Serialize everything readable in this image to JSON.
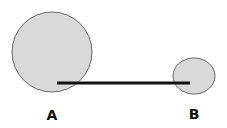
{
  "diagram": {
    "nodes": [
      {
        "id": "A",
        "label": "A",
        "cx": 52,
        "cy": 52,
        "rx": 40,
        "ry": 40
      },
      {
        "id": "B",
        "label": "B",
        "cx": 194,
        "cy": 76,
        "rx": 21,
        "ry": 18
      }
    ],
    "edge": {
      "from": "A",
      "to": "B",
      "x1": 57,
      "y1": 83,
      "x2": 190,
      "y2": 83
    },
    "colors": {
      "fill": "#d9d9d9",
      "stroke": "#666666",
      "line": "#111111",
      "text": "#111111"
    }
  }
}
